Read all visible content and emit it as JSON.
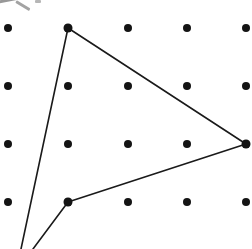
{
  "figure": {
    "background_color": "#ffffff",
    "width": 252,
    "height": 249
  },
  "chart_data": {
    "type": "scatter",
    "title": "",
    "subtitle": "",
    "xlabel": "",
    "ylabel": "",
    "grid": false,
    "legend": false,
    "dot_grid": {
      "columns": 5,
      "rows": 4,
      "column_x": [
        8,
        68,
        128,
        187,
        246
      ],
      "row_y": [
        28,
        86,
        144,
        202
      ],
      "spacing_x": 59.5,
      "spacing_y": 58,
      "dot_radius": 4,
      "dot_color": "#141414",
      "points": [
        {
          "x": 8,
          "y": 28
        },
        {
          "x": 68,
          "y": 28
        },
        {
          "x": 128,
          "y": 28
        },
        {
          "x": 187,
          "y": 28
        },
        {
          "x": 246,
          "y": 28
        },
        {
          "x": 8,
          "y": 86
        },
        {
          "x": 68,
          "y": 86
        },
        {
          "x": 128,
          "y": 86
        },
        {
          "x": 187,
          "y": 86
        },
        {
          "x": 246,
          "y": 86
        },
        {
          "x": 8,
          "y": 144
        },
        {
          "x": 68,
          "y": 144
        },
        {
          "x": 128,
          "y": 144
        },
        {
          "x": 187,
          "y": 144
        },
        {
          "x": 246,
          "y": 144
        },
        {
          "x": 8,
          "y": 202
        },
        {
          "x": 68,
          "y": 202
        },
        {
          "x": 128,
          "y": 202
        },
        {
          "x": 187,
          "y": 202
        },
        {
          "x": 246,
          "y": 202
        }
      ]
    },
    "shape": {
      "name": "triangle",
      "stroke_color": "#1a1a1a",
      "stroke_width": 1.6,
      "fill": "none",
      "vertices": [
        {
          "label": "top",
          "x": 68,
          "y": 28,
          "on_peg": true
        },
        {
          "label": "right",
          "x": 246,
          "y": 144,
          "on_peg": true
        },
        {
          "label": "lower-left",
          "x": 68,
          "y": 202,
          "on_peg": true
        }
      ],
      "edges": [
        {
          "from": "top",
          "to": "right",
          "x1": 68,
          "y1": 28,
          "x2": 246,
          "y2": 144,
          "clipped": false
        },
        {
          "from": "right",
          "to": "lower-left",
          "x1": 246,
          "y1": 144,
          "x2": 68,
          "y2": 202,
          "clipped": false
        },
        {
          "from": "top",
          "to": "off-canvas-apex",
          "x1": 68,
          "y1": 28,
          "x2": 21,
          "y2": 249,
          "clipped": true
        },
        {
          "from": "lower-left",
          "to": "off-canvas-apex",
          "x1": 68,
          "y1": 202,
          "x2": 33,
          "y2": 249,
          "clipped": true
        }
      ],
      "vertex_marker_radius": 4.5
    },
    "marked_vertices": [
      {
        "x": 68,
        "y": 28
      },
      {
        "x": 246,
        "y": 144
      },
      {
        "x": 68,
        "y": 202
      }
    ]
  },
  "artifacts": {
    "top_left_clipped_mark": {
      "present": true,
      "description": "faint cropped ink mark at the very top-left corner, cut off by the image edge",
      "color": "#5a5a5a"
    }
  }
}
